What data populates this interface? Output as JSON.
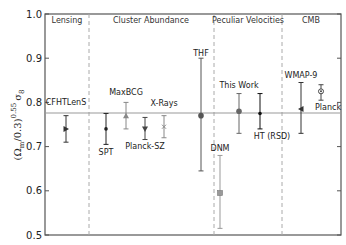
{
  "chart_data": {
    "type": "scatter",
    "title": "",
    "xlabel": "",
    "ylabel": "(Ω_m/0.3)^0.55 σ_8",
    "ylabel_parts": {
      "base": "(Ω",
      "sub_m": "m",
      "mid": "/0.3)",
      "sup": "0.55",
      "sigma": "σ",
      "sub_8": "8"
    },
    "ylim": [
      0.5,
      1.0
    ],
    "yticks": [
      0.5,
      0.6,
      0.7,
      0.8,
      0.9,
      1.0
    ],
    "ytick_labels": [
      "0.5",
      "0.6",
      "0.7",
      "0.8",
      "0.9",
      "1.0"
    ],
    "grid": false,
    "reference_line": 0.776,
    "sections": [
      {
        "name": "Lensing"
      },
      {
        "name": "Cluster Abundance"
      },
      {
        "name": "Peculiar Velocities"
      },
      {
        "name": "CMB"
      }
    ],
    "points": [
      {
        "label": "CFHTLenS",
        "section": "Lensing",
        "value": 0.74,
        "err_low": 0.71,
        "err_high": 0.77,
        "marker": "triangle-right",
        "color": "#333333"
      },
      {
        "label": "SPT",
        "section": "Cluster Abundance",
        "value": 0.74,
        "err_low": 0.705,
        "err_high": 0.775,
        "marker": "dot",
        "color": "#222222"
      },
      {
        "label": "MaxBCG",
        "section": "Cluster Abundance",
        "value": 0.77,
        "err_low": 0.74,
        "err_high": 0.8,
        "marker": "triangle-up",
        "color": "#888888"
      },
      {
        "label": "Planck-SZ",
        "section": "Cluster Abundance",
        "value": 0.74,
        "err_low": 0.716,
        "err_high": 0.766,
        "marker": "triangle-down",
        "color": "#444444"
      },
      {
        "label": "X-Rays",
        "section": "Cluster Abundance",
        "value": 0.745,
        "err_low": 0.72,
        "err_high": 0.77,
        "marker": "x",
        "color": "#888888"
      },
      {
        "label": "THF",
        "section": "Peculiar Velocities",
        "value": 0.77,
        "err_low": 0.645,
        "err_high": 0.9,
        "marker": "circle",
        "color": "#555555"
      },
      {
        "label": "DNM",
        "section": "Peculiar Velocities",
        "value": 0.595,
        "err_low": 0.515,
        "err_high": 0.68,
        "marker": "square",
        "color": "#999999"
      },
      {
        "label": "This Work",
        "section": "Peculiar Velocities",
        "value": 0.78,
        "err_low": 0.73,
        "err_high": 0.82,
        "marker": "circle",
        "color": "#666666"
      },
      {
        "label": "HT (RSD)",
        "section": "Peculiar Velocities",
        "value": 0.775,
        "err_low": 0.74,
        "err_high": 0.82,
        "marker": "dot",
        "color": "#111111"
      },
      {
        "label": "WMAP-9",
        "section": "CMB",
        "value": 0.785,
        "err_low": 0.73,
        "err_high": 0.845,
        "marker": "triangle-left",
        "color": "#333333"
      },
      {
        "label": "Planck",
        "section": "CMB",
        "value": 0.825,
        "err_low": 0.805,
        "err_high": 0.84,
        "marker": "circle-dot",
        "color": "#444444"
      }
    ],
    "legend": null
  }
}
